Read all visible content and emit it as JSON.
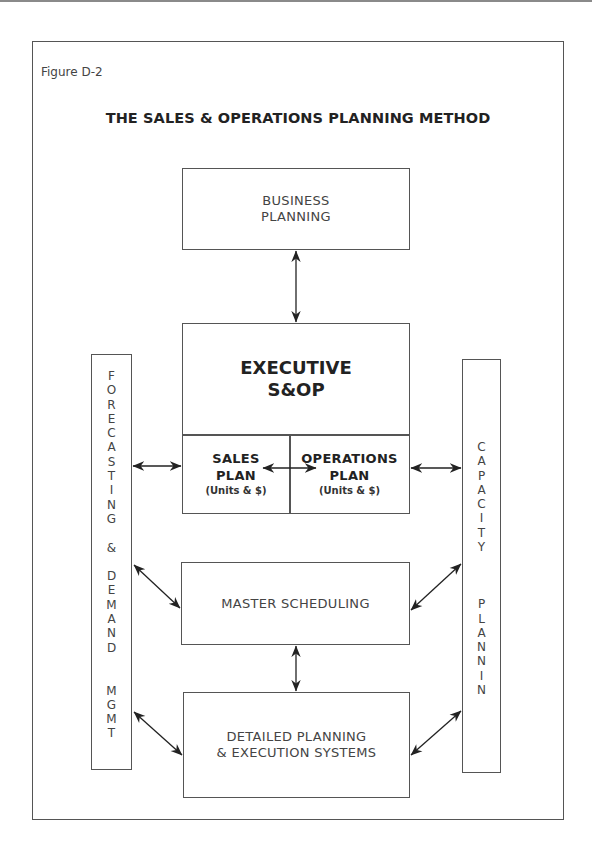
{
  "figure_label": "Figure D-2",
  "title": "THE SALES & OPERATIONS PLANNING METHOD",
  "boxes": {
    "business_planning": {
      "line1": "BUSINESS",
      "line2": "PLANNING"
    },
    "executive_sop": {
      "line1": "EXECUTIVE",
      "line2": "S&OP",
      "sales_plan": {
        "line1": "SALES",
        "line2": "PLAN",
        "sub": "(Units & $)"
      },
      "operations_plan": {
        "line1": "OPERATIONS",
        "line2": "PLAN",
        "sub": "(Units & $)"
      }
    },
    "master_scheduling": {
      "label": "MASTER SCHEDULING"
    },
    "detailed_planning": {
      "line1": "DETAILED PLANNING",
      "line2": "& EXECUTION SYSTEMS"
    },
    "forecasting": {
      "letters": [
        "F",
        "O",
        "R",
        "E",
        "C",
        "A",
        "S",
        "T",
        "I",
        "N",
        "G",
        "",
        "&",
        "",
        "D",
        "E",
        "M",
        "A",
        "N",
        "D",
        "",
        "M",
        "G",
        "M",
        "T"
      ]
    },
    "capacity": {
      "letters": [
        "C",
        "A",
        "P",
        "A",
        "C",
        "I",
        "T",
        "Y",
        "",
        "",
        "P",
        "L",
        "A",
        "N",
        "N",
        "I",
        "N",
        "G"
      ]
    }
  },
  "colors": {
    "line": "#555555",
    "text": "#444444",
    "bold_text": "#222222"
  }
}
